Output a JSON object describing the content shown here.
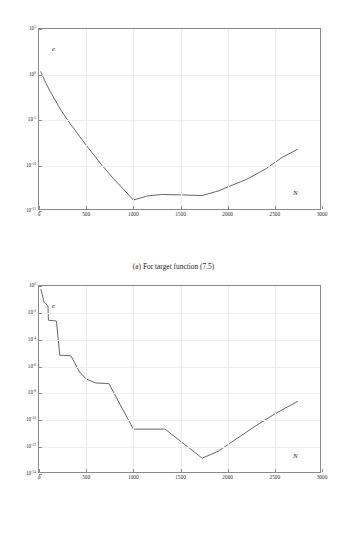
{
  "page": {
    "background_color": "#ffffff",
    "axis_color": "#8a8a8a",
    "grid_color": "#ededed",
    "curve_color": "#4a4a4a"
  },
  "figures": [
    {
      "id": "figure-a",
      "caption": "(a) For target function (7.5)",
      "y_axis_name": "e",
      "x_axis_name": "N",
      "x_ticks": [
        "0",
        "500",
        "1000",
        "1500",
        "2000",
        "2500",
        "3000"
      ],
      "y_ticks": [
        "10",
        "10",
        "10",
        "10",
        "10"
      ],
      "y_tick_exponents": [
        "5",
        "0",
        "-5",
        "-10",
        "-15"
      ]
    },
    {
      "id": "figure-b",
      "caption": "(b) For target function (7.6)",
      "y_axis_name": "e",
      "x_axis_name": "N",
      "x_ticks": [
        "0",
        "500",
        "1000",
        "1500",
        "2000",
        "2500",
        "3000"
      ],
      "y_ticks": [
        "10",
        "10",
        "10",
        "10",
        "10",
        "10",
        "10",
        "10"
      ],
      "y_tick_exponents": [
        "0",
        "-2",
        "-4",
        "-6",
        "-8",
        "-10",
        "-12",
        "-14"
      ]
    }
  ],
  "chart_data": [
    {
      "type": "line",
      "title": "(a) For target function (7.5)",
      "xlabel": "N",
      "ylabel": "e",
      "yscale": "log",
      "xlim": [
        0,
        3000
      ],
      "ylim": [
        1e-15,
        100000.0
      ],
      "grid": true,
      "legend": null,
      "xticks": [
        0,
        500,
        1000,
        1500,
        2000,
        2500,
        3000
      ],
      "yticks": [
        100000.0,
        1.0,
        1e-05,
        1e-10,
        1e-15
      ],
      "x": [
        20,
        60,
        110,
        170,
        240,
        330,
        430,
        540,
        660,
        790,
        900,
        1000,
        1150,
        1300,
        1470,
        1600,
        1730,
        1900,
        2050,
        2200,
        2400,
        2570,
        2740
      ],
      "y": [
        2.0,
        0.22,
        0.02,
        0.0016,
        9e-05,
        4e-06,
        1.6e-07,
        5e-09,
        1.3e-10,
        3.5e-12,
        2.2e-13,
        1.6e-14,
        4.5e-14,
        6.5e-14,
        6e-14,
        5.5e-14,
        5e-14,
        1.6e-13,
        7e-13,
        3e-12,
        4e-11,
        7e-10,
        6e-09
      ]
    },
    {
      "type": "line",
      "title": "(b) For target function (7.6)",
      "xlabel": "N",
      "ylabel": "e",
      "yscale": "log",
      "xlim": [
        0,
        3000
      ],
      "ylim": [
        1e-14,
        1.0
      ],
      "grid": true,
      "legend": null,
      "xticks": [
        0,
        500,
        1000,
        1500,
        2000,
        2500,
        3000
      ],
      "yticks": [
        1.0,
        0.01,
        0.0001,
        1e-06,
        1e-08,
        1e-10,
        1e-12,
        1e-14
      ],
      "x": [
        20,
        55,
        95,
        100,
        180,
        185,
        220,
        330,
        340,
        430,
        500,
        600,
        730,
        740,
        1000,
        1330,
        1340,
        1730,
        1900,
        2100,
        2300,
        2500,
        2740
      ],
      "y": [
        0.55,
        0.06,
        0.035,
        0.0028,
        0.0025,
        0.0024,
        7e-06,
        6.5e-06,
        6e-06,
        4e-07,
        1.2e-07,
        6e-08,
        5.5e-08,
        5.5e-08,
        2.2e-11,
        2.2e-11,
        2.1e-11,
        1.5e-13,
        5e-13,
        4.5e-12,
        4e-11,
        3e-10,
        2.5e-09
      ]
    }
  ]
}
